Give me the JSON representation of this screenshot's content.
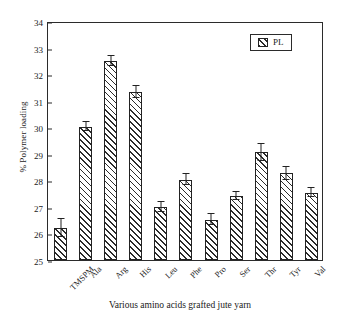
{
  "chart_data": {
    "type": "bar",
    "title": "",
    "xlabel": "Various amino acids grafted jute yarn",
    "ylabel": "% Polymer loading",
    "ylim": [
      25,
      34
    ],
    "ytick_step": 1,
    "yticks": [
      "34",
      "33",
      "32",
      "31",
      "30",
      "29",
      "28",
      "27",
      "26",
      "25"
    ],
    "grid": false,
    "legend_position": "top-right",
    "legend": [
      "PL"
    ],
    "categories": [
      "TMSPM",
      "Ala",
      "Arg",
      "His",
      "Leu",
      "Phe",
      "Pro",
      "Ser",
      "Thr",
      "Tyr",
      "Val"
    ],
    "series": [
      {
        "name": "PL",
        "values": [
          26.2,
          30.02,
          32.5,
          31.32,
          27.0,
          28.03,
          26.52,
          27.4,
          29.05,
          28.27,
          27.54
        ],
        "errors": [
          0.33,
          0.18,
          0.2,
          0.22,
          0.2,
          0.2,
          0.22,
          0.15,
          0.32,
          0.25,
          0.17
        ],
        "fill": "diagonal-hatch",
        "edge_color": "#222222",
        "face_color": "#ffffff"
      }
    ]
  },
  "axes": {
    "y_title": "% Polymer loading",
    "x_title": "Various amino acids grafted jute yarn"
  },
  "legend": {
    "label": "PL"
  }
}
